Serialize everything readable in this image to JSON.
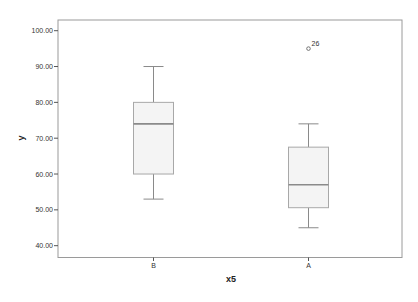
{
  "chart_data": {
    "type": "boxplot",
    "title": "",
    "xlabel": "x5",
    "ylabel": "y",
    "categories": [
      "B",
      "A"
    ],
    "ylim": [
      37,
      103
    ],
    "y_ticks": [
      "100.00",
      "90.00",
      "80.00",
      "70.00",
      "60.00",
      "50.00",
      "40.00"
    ],
    "y_tick_values": [
      100,
      90,
      80,
      70,
      60,
      50,
      40
    ],
    "grid": false,
    "legend": null,
    "boxes": [
      {
        "category": "B",
        "whisker_low": 53,
        "q1": 60,
        "median": 74,
        "q3": 80,
        "whisker_high": 90,
        "outliers": []
      },
      {
        "category": "A",
        "whisker_low": 45,
        "q1": 50.6,
        "median": 57,
        "q3": 67.5,
        "whisker_high": 74,
        "outliers": [
          {
            "value": 95,
            "label": "26"
          }
        ]
      }
    ],
    "colors": {
      "box_fill": "#f4f4f4",
      "box_stroke": "#a8a8a8",
      "median": "#8a8a8a",
      "whisker": "#8a8a8a",
      "frame": "#9a9a9a"
    }
  }
}
